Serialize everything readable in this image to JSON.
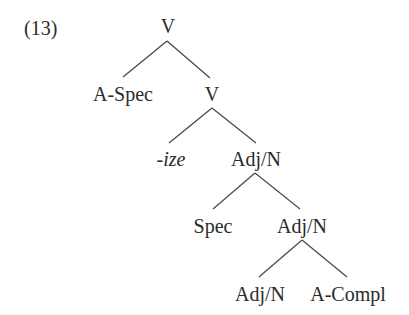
{
  "example": {
    "number": "(13)"
  },
  "tree": {
    "root": {
      "label": "V",
      "x": 168,
      "y": 16
    },
    "nodes": [
      {
        "id": "aspec",
        "label": "A-Spec",
        "x": 123,
        "y": 84,
        "italic": false
      },
      {
        "id": "v2",
        "label": "V",
        "x": 212,
        "y": 84,
        "italic": false
      },
      {
        "id": "ize",
        "label": "-ize",
        "x": 170,
        "y": 149,
        "italic": true
      },
      {
        "id": "adjn1",
        "label": "Adj/N",
        "x": 256,
        "y": 149,
        "italic": false
      },
      {
        "id": "spec",
        "label": "Spec",
        "x": 213,
        "y": 216,
        "italic": false
      },
      {
        "id": "adjn2",
        "label": "Adj/N",
        "x": 302,
        "y": 216,
        "italic": false
      },
      {
        "id": "adjn3",
        "label": "Adj/N",
        "x": 260,
        "y": 284,
        "italic": false
      },
      {
        "id": "acompl",
        "label": "A-Compl",
        "x": 348,
        "y": 284,
        "italic": false
      }
    ],
    "edges": [
      {
        "from": "V",
        "to": "A-Spec",
        "x1": 167,
        "y1": 41,
        "x2": 123,
        "y2": 77
      },
      {
        "from": "V",
        "to": "V",
        "x1": 167,
        "y1": 41,
        "x2": 210,
        "y2": 78
      },
      {
        "from": "V",
        "to": "-ize",
        "x1": 212,
        "y1": 108,
        "x2": 169,
        "y2": 143
      },
      {
        "from": "V",
        "to": "Adj/N",
        "x1": 212,
        "y1": 108,
        "x2": 256,
        "y2": 143
      },
      {
        "from": "Adj/N",
        "to": "Spec",
        "x1": 255,
        "y1": 173,
        "x2": 213,
        "y2": 209
      },
      {
        "from": "Adj/N",
        "to": "Adj/N",
        "x1": 255,
        "y1": 173,
        "x2": 300,
        "y2": 209
      },
      {
        "from": "Adj/N",
        "to": "Adj/N",
        "x1": 302,
        "y1": 240,
        "x2": 259,
        "y2": 277
      },
      {
        "from": "Adj/N",
        "to": "A-Compl",
        "x1": 302,
        "y1": 240,
        "x2": 347,
        "y2": 277
      }
    ]
  }
}
